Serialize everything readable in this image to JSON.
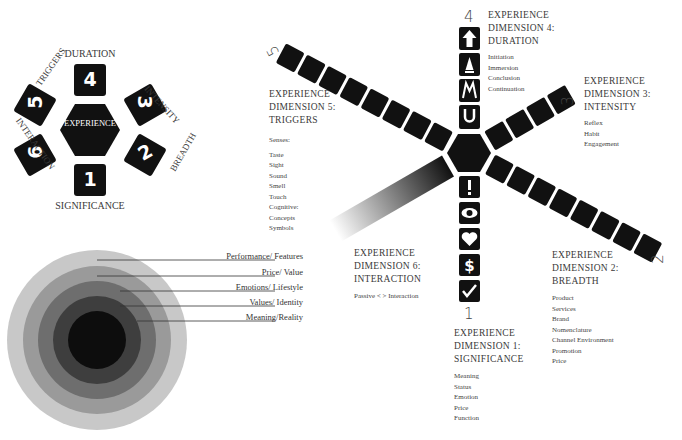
{
  "hex_diagram": {
    "center_label": "EXPERIENCE",
    "tiles": [
      {
        "number": "4",
        "label": "DURATION"
      },
      {
        "number": "3",
        "label": "INTENSITY"
      },
      {
        "number": "2",
        "label": "BREADTH"
      },
      {
        "number": "1",
        "label": "SIGNIFICANCE"
      },
      {
        "number": "6",
        "label": "INTERACTION"
      },
      {
        "number": "5",
        "label": "TRIGGERS"
      }
    ]
  },
  "rings": {
    "labels": [
      "Performance/ Features",
      "Price/ Value",
      "Emotions/ Lifestyle",
      "Values/ Identity",
      "Meaning/Reality"
    ],
    "colors": [
      "#c8c8c8",
      "#9a9a9a",
      "#6e6e6e",
      "#3e3e3e",
      "#0d0d0d"
    ]
  },
  "dimensions": {
    "d1": {
      "number": "1",
      "title": [
        "EXPERIENCE",
        "DIMENSION 1:",
        "SIGNIFICANCE"
      ],
      "items": [
        "Meaning",
        "Status",
        "Emotion",
        "Price",
        "Function"
      ]
    },
    "d2": {
      "number": "2",
      "title": [
        "EXPERIENCE",
        "DIMENSION 2:",
        "BREADTH"
      ],
      "items": [
        "Product",
        "Services",
        "Brand",
        "Nomenclature",
        "Channel Environment",
        "Promotion",
        "Price"
      ]
    },
    "d3": {
      "number": "3",
      "title": [
        "EXPERIENCE",
        "DIMENSION 3:",
        "INTENSITY"
      ],
      "items": [
        "Reflex",
        "Habit",
        "Engagement"
      ]
    },
    "d4": {
      "number": "4",
      "title": [
        "EXPERIENCE",
        "DIMENSION 4:",
        "DURATION"
      ],
      "items": [
        "Initiation",
        "Immersion",
        "Conclusion",
        "Continuation"
      ]
    },
    "d5": {
      "number": "5",
      "title": [
        "EXPERIENCE",
        "DIMENSION 5:",
        "TRIGGERS"
      ],
      "subhead": "Senses:",
      "items": [
        "Taste",
        "Sight",
        "Sound",
        "Smell",
        "Touch",
        "Cognitive:",
        "Concepts",
        "Symbols"
      ]
    },
    "d6": {
      "number": "6",
      "title": [
        "EXPERIENCE",
        "DIMENSION 6:",
        "INTERACTION"
      ],
      "items": [
        "Passive < > Interaction"
      ]
    }
  },
  "icons": {
    "duration": [
      "arrow-up-icon",
      "cone-icon",
      "climb-icon",
      "loop-icon"
    ],
    "significance": [
      "exclamation-icon",
      "eye-icon",
      "heart-icon",
      "dollar-icon",
      "checkmark-icon"
    ]
  }
}
